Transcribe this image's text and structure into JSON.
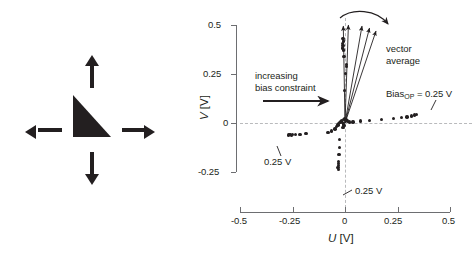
{
  "figure": {
    "panels": [
      "icon-panel",
      "scatter-plot"
    ]
  },
  "icon_panel": {
    "shape_name": "right-triangle",
    "arrows": [
      {
        "name": "arrow-up",
        "direction": "up"
      },
      {
        "name": "arrow-down",
        "direction": "down"
      },
      {
        "name": "arrow-left",
        "direction": "left"
      },
      {
        "name": "arrow-right",
        "direction": "right"
      }
    ],
    "fill_color": "#231f20"
  },
  "chart_data": {
    "type": "scatter",
    "title": "",
    "xlabel": "U [V]",
    "ylabel": "V [V]",
    "xlabel_symbol": "U",
    "xlabel_unit": "[V]",
    "ylabel_symbol": "V",
    "ylabel_unit": "[V]",
    "xlim": [
      -0.5,
      0.5
    ],
    "ylim": [
      -0.25,
      0.5
    ],
    "xticks": [
      -0.5,
      -0.25,
      0,
      0.25,
      0.5
    ],
    "xticklabels": [
      "-0.5",
      "-0.25",
      "0",
      "0.25",
      "0.5"
    ],
    "yticks": [
      -0.25,
      0,
      0.25,
      0.5
    ],
    "yticklabels": [
      "-0.25",
      "0",
      "0.25",
      "0.5"
    ],
    "grid": "dashed zero-lines at x=0 and y=0",
    "legend": "none",
    "marker_color": "#231f20",
    "points": [
      [
        -0.268,
        -0.062
      ],
      [
        -0.262,
        -0.06
      ],
      [
        -0.256,
        -0.063
      ],
      [
        -0.249,
        -0.06
      ],
      [
        -0.236,
        -0.06
      ],
      [
        -0.215,
        -0.058
      ],
      [
        -0.186,
        -0.055
      ],
      [
        -0.081,
        -0.05
      ],
      [
        -0.063,
        -0.041
      ],
      [
        -0.047,
        -0.03
      ],
      [
        -0.04,
        -0.018
      ],
      [
        -0.034,
        -0.01
      ],
      [
        -0.03,
        -0.004
      ],
      [
        -0.026,
        0.001
      ],
      [
        -0.021,
        0.006
      ],
      [
        -0.017,
        0.011
      ],
      [
        -0.012,
        0.004
      ],
      [
        -0.008,
        -0.006
      ],
      [
        -0.004,
        -0.014
      ],
      [
        -0.01,
        -0.022
      ],
      [
        -0.006,
        0.018
      ],
      [
        -0.002,
        0.022
      ],
      [
        0.004,
        0.016
      ],
      [
        0.011,
        0.01
      ],
      [
        0.02,
        0.006
      ],
      [
        0.038,
        0.005
      ],
      [
        0.074,
        0.01
      ],
      [
        0.118,
        0.013
      ],
      [
        0.175,
        0.018
      ],
      [
        0.23,
        0.022
      ],
      [
        0.268,
        0.028
      ],
      [
        0.296,
        0.031
      ],
      [
        0.318,
        0.036
      ],
      [
        0.332,
        0.04
      ],
      [
        0.34,
        0.043
      ],
      [
        -0.01,
        0.43
      ],
      [
        -0.008,
        0.418
      ],
      [
        -0.012,
        0.406
      ],
      [
        -0.009,
        0.395
      ],
      [
        -0.011,
        0.383
      ],
      [
        -0.006,
        0.372
      ],
      [
        -0.004,
        0.34
      ],
      [
        0.008,
        0.3
      ],
      [
        0.006,
        0.288
      ],
      [
        0.003,
        0.252
      ],
      [
        -0.001,
        0.165
      ],
      [
        -0.026,
        -0.085
      ],
      [
        -0.027,
        -0.125
      ],
      [
        -0.028,
        -0.16
      ],
      [
        -0.03,
        -0.196
      ],
      [
        -0.032,
        -0.206
      ],
      [
        -0.031,
        -0.216
      ],
      [
        -0.033,
        -0.226
      ],
      [
        -0.03,
        -0.236
      ]
    ],
    "vectors": [
      {
        "name": "vector-1",
        "angle_deg": 91,
        "length": 0.49
      },
      {
        "name": "vector-2",
        "angle_deg": 88,
        "length": 0.5
      },
      {
        "name": "vector-3",
        "angle_deg": 80,
        "length": 0.5
      },
      {
        "name": "vector-4",
        "angle_deg": 76,
        "length": 0.5
      },
      {
        "name": "vector-5",
        "angle_deg": 72,
        "length": 0.5
      }
    ],
    "annotations": [
      {
        "name": "increasing-bias-constraint-label",
        "text_line1": "increasing",
        "text_line2": "bias constraint"
      },
      {
        "name": "vector-average-label",
        "text_line1": "vector",
        "text_line2": "average"
      },
      {
        "name": "bias-op-label",
        "prefix": "Bias",
        "sub": "OP",
        "suffix": " = 0.25 V"
      },
      {
        "name": "left-branch-label",
        "text": "0.25 V"
      },
      {
        "name": "bottom-branch-label",
        "text": "0.25 V"
      }
    ],
    "arrows": [
      {
        "name": "increasing-bias-arrow",
        "direction": "right"
      },
      {
        "name": "rotation-sweep-arrow",
        "direction": "clockwise-curve"
      }
    ]
  }
}
